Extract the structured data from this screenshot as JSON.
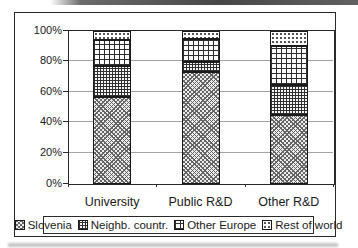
{
  "colors": {
    "frame_border": "#2a2a2a",
    "gridline": "#a3a3a3",
    "text": "#1a1a1a",
    "background": "#ffffff"
  },
  "chart_data": {
    "type": "bar",
    "stacked": true,
    "percent_stacked": true,
    "title": "",
    "xlabel": "",
    "ylabel": "",
    "categories": [
      "University",
      "Public R&D",
      "Other R&D"
    ],
    "series": [
      {
        "name": "Slovenia",
        "pattern": "diagonal-checker",
        "values": [
          57,
          73,
          45
        ]
      },
      {
        "name": "Neighb. countr.",
        "pattern": "fine-grid",
        "values": [
          20,
          7,
          20
        ]
      },
      {
        "name": "Other Europe",
        "pattern": "coarse-grid",
        "values": [
          17,
          15,
          25
        ]
      },
      {
        "name": "Rest of world",
        "pattern": "dots",
        "values": [
          6,
          5,
          10
        ]
      }
    ],
    "y_ticks": [
      "0%",
      "20%",
      "40%",
      "60%",
      "80%",
      "100%"
    ],
    "ylim": [
      0,
      100
    ],
    "grid": true,
    "legend_position": "bottom"
  }
}
